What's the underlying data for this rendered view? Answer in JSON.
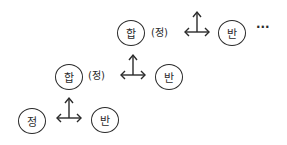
{
  "diagram": {
    "type": "dialectic staircase",
    "rows": [
      {
        "level": 1,
        "left_node": "정",
        "right_node": "반",
        "left_note": "",
        "connector": "bidirectional-arrow-with-up-arrow"
      },
      {
        "level": 2,
        "left_node": "합",
        "left_note": "(정)",
        "right_node": "반",
        "connector": "bidirectional-arrow-with-up-arrow"
      },
      {
        "level": 3,
        "left_node": "합",
        "left_note": "(정)",
        "right_node": "반",
        "connector": "bidirectional-arrow-with-up-arrow",
        "continuation": "···"
      }
    ]
  }
}
